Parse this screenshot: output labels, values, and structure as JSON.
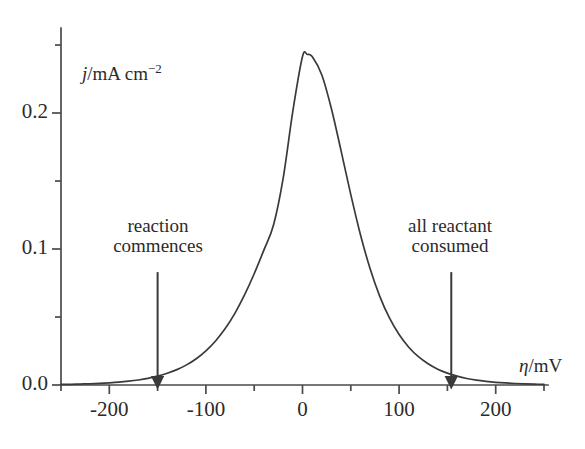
{
  "figure": {
    "background_color": "#ffffff",
    "line_color": "#3a3a3a",
    "axis_color": "#4a4a4a",
    "text_color": "#2b2b2b"
  },
  "axes": {
    "y_title_italic": "j",
    "y_title_rest": "/mA cm",
    "y_title_exponent": "−2",
    "x_title_italic": "η",
    "x_title_rest": "/mV",
    "y_tick_labels": [
      "0.0",
      "0.1",
      "0.2"
    ],
    "x_tick_labels": [
      "-200",
      "-100",
      "0",
      "100",
      "200"
    ]
  },
  "annotations": {
    "left": {
      "line1": "reaction",
      "line2": "commences"
    },
    "right": {
      "line1": "all reactant",
      "line2": "consumed"
    }
  },
  "chart_data": {
    "type": "line",
    "title": "",
    "xlabel": "η/mV",
    "ylabel": "j/mA cm⁻²",
    "xlim": [
      -250,
      255
    ],
    "ylim": [
      0.0,
      0.26
    ],
    "grid": false,
    "legend": null,
    "x_ticks": [
      -200,
      -100,
      0,
      100,
      200
    ],
    "x_minor_ticks": [
      -250,
      -150,
      -50,
      50,
      150,
      250
    ],
    "y_ticks": [
      0.0,
      0.1,
      0.2
    ],
    "y_minor_ticks": [
      0.05,
      0.15,
      0.25
    ],
    "peak": {
      "x": 5,
      "y": 0.243
    },
    "series": [
      {
        "name": "current density",
        "x": [
          -250,
          -240,
          -230,
          -220,
          -210,
          -200,
          -190,
          -180,
          -170,
          -160,
          -150,
          -140,
          -130,
          -120,
          -110,
          -100,
          -90,
          -80,
          -70,
          -60,
          -50,
          -40,
          -30,
          -20,
          -10,
          0,
          5,
          10,
          20,
          30,
          40,
          50,
          60,
          70,
          80,
          90,
          100,
          110,
          120,
          130,
          140,
          150,
          160,
          170,
          180,
          190,
          200,
          210,
          220,
          230,
          240,
          250
        ],
        "y": [
          0.0004,
          0.0005,
          0.0007,
          0.0009,
          0.0012,
          0.0016,
          0.0021,
          0.0028,
          0.0037,
          0.0049,
          0.0065,
          0.0086,
          0.0113,
          0.0148,
          0.0193,
          0.0251,
          0.0324,
          0.0415,
          0.0527,
          0.0662,
          0.0818,
          0.0992,
          0.1176,
          0.1521,
          0.2014,
          0.2415,
          0.243,
          0.2415,
          0.228,
          0.203,
          0.172,
          0.14,
          0.1105,
          0.0855,
          0.0652,
          0.0493,
          0.0371,
          0.0278,
          0.0208,
          0.0156,
          0.0116,
          0.0087,
          0.0065,
          0.0048,
          0.0036,
          0.0027,
          0.002,
          0.0015,
          0.0011,
          0.0008,
          0.0006,
          0.0005
        ]
      }
    ],
    "arrows": [
      {
        "name": "reaction-commences-arrow",
        "x": -150,
        "y_from": 0.083,
        "y_to": 0.005
      },
      {
        "name": "all-reactant-consumed-arrow",
        "x": 154,
        "y_from": 0.083,
        "y_to": 0.005
      }
    ]
  }
}
